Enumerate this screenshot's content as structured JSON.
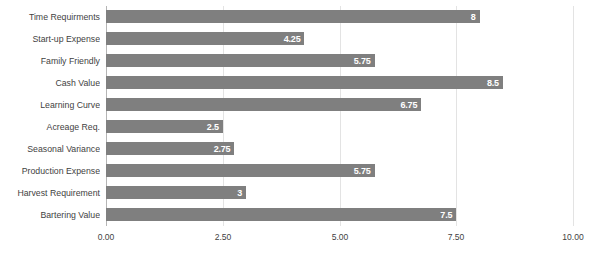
{
  "chart_data": {
    "type": "bar",
    "orientation": "horizontal",
    "title": "",
    "xlabel": "",
    "ylabel": "",
    "xlim": [
      0,
      10
    ],
    "grid": true,
    "legend": false,
    "bar_color": "#7f7f7f",
    "label_color": "#ffffff",
    "axis_text_color": "#3f3f3f",
    "gridline_color": "#e3e3e3",
    "axis_line_color": "#b5b5b5",
    "xticks": [
      "0.00",
      "2.50",
      "5.00",
      "7.50",
      "10.00"
    ],
    "xtick_values": [
      0,
      2.5,
      5,
      7.5,
      10
    ],
    "categories": [
      "Time Requirments",
      "Start-up Expense",
      "Family Friendly",
      "Cash Value",
      "Learning Curve",
      "Acreage Req.",
      "Seasonal Variance",
      "Production Expense",
      "Harvest Requirement",
      "Bartering Value"
    ],
    "values": [
      8,
      4.25,
      5.75,
      8.5,
      6.75,
      2.5,
      2.75,
      5.75,
      3,
      7.5
    ],
    "value_labels": [
      "8",
      "4.25",
      "5.75",
      "8.5",
      "6.75",
      "2.5",
      "2.75",
      "5.75",
      "3",
      "7.5"
    ]
  }
}
